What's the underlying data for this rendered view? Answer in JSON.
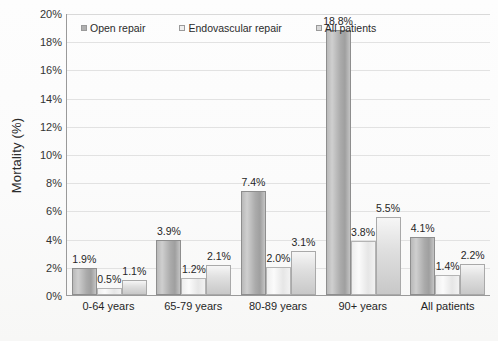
{
  "chart_data": {
    "type": "bar",
    "title": "",
    "xlabel": "",
    "ylabel": "Mortality (%)",
    "ylim": [
      0,
      20
    ],
    "ytick_step": 2,
    "grid": true,
    "legend_position": "top-left",
    "categories": [
      "0-64 years",
      "65-79 years",
      "80-89 years",
      "90+ years",
      "All patients"
    ],
    "series": [
      {
        "name": "Open repair",
        "color": "#b0b0b0",
        "values": [
          1.9,
          3.9,
          7.4,
          18.8,
          4.1
        ],
        "labels": [
          "1.9%",
          "3.9%",
          "7.4%",
          "18.8%",
          "4.1%"
        ]
      },
      {
        "name": "Endovascular repair",
        "color": "#efefef",
        "values": [
          0.5,
          1.2,
          2.0,
          3.8,
          1.4
        ],
        "labels": [
          "0.5%",
          "1.2%",
          "2.0%",
          "3.8%",
          "1.4%"
        ]
      },
      {
        "name": "All patients",
        "color": "#d8d8d8",
        "values": [
          1.1,
          2.1,
          3.1,
          5.5,
          2.2
        ],
        "labels": [
          "1.1%",
          "2.1%",
          "3.1%",
          "5.5%",
          "2.2%"
        ]
      }
    ],
    "ytick_labels": [
      "20%",
      "18%",
      "16%",
      "14%",
      "12%",
      "10%",
      "8%",
      "6%",
      "4%",
      "2%",
      "0%"
    ],
    "ytick_values": [
      20,
      18,
      16,
      14,
      12,
      10,
      8,
      6,
      4,
      2,
      0
    ]
  }
}
